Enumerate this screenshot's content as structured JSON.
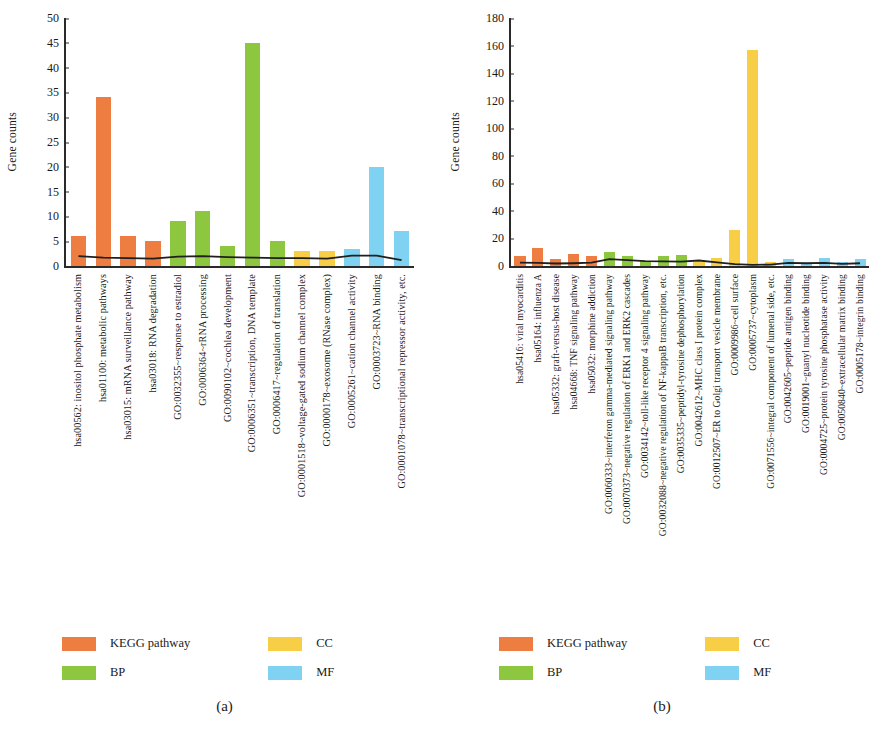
{
  "figure": {
    "panels": [
      {
        "caption": "(a)",
        "ylabel": "Gene counts",
        "legend": [
          {
            "label": "KEGG pathway",
            "color": "#ED7D40"
          },
          {
            "label": "CC",
            "color": "#F7CE46"
          },
          {
            "label": "BP",
            "color": "#8DC63F"
          },
          {
            "label": "MF",
            "color": "#7FD2F2"
          }
        ]
      },
      {
        "caption": "(b)",
        "ylabel": "Gene counts",
        "legend": [
          {
            "label": "KEGG pathway",
            "color": "#ED7D40"
          },
          {
            "label": "CC",
            "color": "#F7CE46"
          },
          {
            "label": "BP",
            "color": "#8DC63F"
          },
          {
            "label": "MF",
            "color": "#7FD2F2"
          }
        ]
      }
    ]
  },
  "chart_data": [
    {
      "type": "bar",
      "title": "(a)",
      "xlabel": "",
      "ylabel": "Gene counts",
      "ylim": [
        0,
        50
      ],
      "yticks": [
        0,
        5,
        10,
        15,
        20,
        25,
        30,
        35,
        40,
        45,
        50
      ],
      "grid": false,
      "legend_position": "bottom",
      "categories": [
        "hsa00562: inositol phosphate metabolism",
        "hsa01100: metabolic pathways",
        "hsa03015: mRNA surveillance pathway",
        "hsa03018: RNA degradation",
        "GO:0032355~response to estradiol",
        "GO:0006364~rRNA processing",
        "GO:0090102~cochlea development",
        "GO:0006351~transcription, DNA template",
        "GO:0006417~regulation of translation",
        "GO:0001518~voltage-gated sodium channel complex",
        "GO:0000178~exosome (RNase complex)",
        "GO:0005261~cation channel activity",
        "GO:0003723~RNA binding",
        "GO:0001078~transcriptional repressor activity, etc."
      ],
      "values": [
        6,
        34,
        6,
        5,
        9,
        11,
        4,
        45,
        5,
        3,
        3,
        3.5,
        20,
        7
      ],
      "categories_short": [
        "hsa00562: inositol phosphate metabolism",
        "hsa01100: metabolic pathways",
        "hsa03015: mRNA surveillance pathway",
        "hsa03018: RNA degradation",
        "GO:0032355~response to estradiol",
        "GO:0006364~rRNA processing",
        "GO:0090102~cochlea development",
        "GO:0006351~transcription, DNA template",
        "GO:0006417~regulation of translation",
        "GO:0001518~voltage-gated sodium channel complex",
        "GO:0000178~exosome (RNase complex)",
        "GO:0005261~cation channel activity",
        "GO:0003723~RNA binding",
        "GO:0001078~transcriptional repressor activity, etc."
      ],
      "bar_colors": [
        "#ED7D40",
        "#ED7D40",
        "#ED7D40",
        "#ED7D40",
        "#8DC63F",
        "#8DC63F",
        "#8DC63F",
        "#8DC63F",
        "#8DC63F",
        "#F7CE46",
        "#F7CE46",
        "#7FD2F2",
        "#7FD2F2",
        "#7FD2F2"
      ],
      "series": [
        {
          "name": "Gene counts",
          "values": [
            6,
            34,
            6,
            5,
            9,
            11,
            4,
            45,
            5,
            3,
            3,
            3.5,
            20,
            7
          ]
        },
        {
          "name": "trend line",
          "type": "line",
          "values": [
            2.0,
            1.7,
            1.6,
            1.5,
            1.9,
            2.0,
            1.8,
            1.7,
            1.6,
            1.6,
            1.5,
            2.1,
            2.1,
            1.2
          ]
        }
      ]
    },
    {
      "type": "bar",
      "title": "(b)",
      "xlabel": "",
      "ylabel": "Gene counts",
      "ylim": [
        0,
        180
      ],
      "yticks": [
        0,
        20,
        40,
        60,
        80,
        100,
        120,
        140,
        160,
        180
      ],
      "grid": false,
      "legend_position": "bottom",
      "categories": [
        "hsa05416: viral myocarditis",
        "hsa05164: influenza A",
        "hsa05332: graft-versus-host disease",
        "hsa04668: TNF signaling pathway",
        "hsa05032: morphine addiction",
        "GO:0060333~interferon gamma-mediated signaling pathway",
        "GO:0070373~negative regulation of ERK1 and ERK2 cascades",
        "GO:0034142~toll-like receptor 4 signaling pathway",
        "GO:0032088~negative regulation of NF-kappaB transcription, etc.",
        "GO:0035335~peptidyl-tyrosine dephosphorylation",
        "GO:0042612~MHC class I protein complex",
        "GO:0012507~ER to Golgi transport vesicle membrane",
        "GO:0009986~cell surface",
        "GO:0005737~cytoplasm",
        "GO:0071556~integral component of lumenal side, etc.",
        "GO:0042605~peptide antigen binding",
        "GO:0019001~guanyl nucleotide binding",
        "GO:0004725~protein tyrosine phosphatase activity",
        "GO:0050840~extracellular matrix binding",
        "GO:0005178~integrin binding"
      ],
      "values": [
        7,
        13,
        5,
        9,
        7,
        10,
        7,
        4,
        7,
        8,
        3,
        6,
        26,
        157,
        3,
        5,
        2,
        6,
        3,
        5
      ],
      "bar_colors": [
        "#ED7D40",
        "#ED7D40",
        "#ED7D40",
        "#ED7D40",
        "#ED7D40",
        "#8DC63F",
        "#8DC63F",
        "#8DC63F",
        "#8DC63F",
        "#8DC63F",
        "#F7CE46",
        "#F7CE46",
        "#F7CE46",
        "#F7CE46",
        "#F7CE46",
        "#7FD2F2",
        "#7FD2F2",
        "#7FD2F2",
        "#7FD2F2",
        "#7FD2F2"
      ],
      "series": [
        {
          "name": "Gene counts",
          "values": [
            7,
            13,
            5,
            9,
            7,
            10,
            7,
            4,
            7,
            8,
            3,
            6,
            26,
            157,
            3,
            5,
            2,
            6,
            3,
            5
          ]
        },
        {
          "name": "trend line",
          "type": "line",
          "values": [
            2.5,
            2.2,
            1.8,
            2.0,
            2.4,
            5.0,
            4.2,
            3.6,
            3.4,
            3.2,
            4.0,
            2.6,
            1.4,
            0.8,
            1.0,
            2.2,
            2.0,
            2.2,
            1.5,
            2.0
          ]
        }
      ]
    }
  ]
}
